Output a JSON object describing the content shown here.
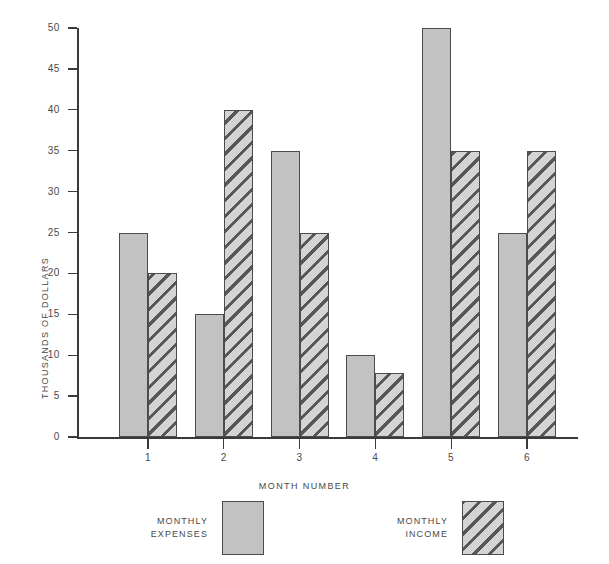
{
  "chart_data": {
    "type": "bar",
    "title": "",
    "xlabel": "MONTH NUMBER",
    "ylabel": "THOUSANDS OF DOLLARS",
    "categories": [
      "1",
      "2",
      "3",
      "4",
      "5",
      "6"
    ],
    "series": [
      {
        "name": "MONTHLY\nEXPENSES",
        "legend_label": "MONTHLY\nEXPENSES",
        "style": "solid-gray",
        "values": [
          25,
          15,
          35,
          10,
          50,
          25
        ]
      },
      {
        "name": "MONTHLY\nINCOME",
        "legend_label": "MONTHLY\nINCOME",
        "style": "diagonal-hatch",
        "values": [
          20,
          40,
          25,
          7.8,
          35,
          35
        ]
      }
    ],
    "ylim": [
      0,
      50
    ],
    "ytick_step": 5,
    "yticks": [
      "0",
      "5",
      "10",
      "15",
      "20",
      "25",
      "30",
      "35",
      "40",
      "45",
      "50"
    ],
    "grid": false,
    "legend_position": "below-plot",
    "colors": {
      "expenses_fill": "#c2c2c2",
      "income_fill": "#d4d4d4",
      "income_hatch": "#575757",
      "bar_border": "#4c4c4c",
      "axis": "#3a3a3a",
      "text": "#4a4a4a",
      "background": "#ffffff"
    }
  },
  "axes": {
    "x_title": "MONTH NUMBER",
    "y_title": "THOUSANDS OF DOLLARS"
  },
  "legend": {
    "items": [
      {
        "label": "MONTHLY\nEXPENSES",
        "swatch": "solid-gray-swatch"
      },
      {
        "label": "MONTHLY\nINCOME",
        "swatch": "hatched-swatch"
      }
    ]
  }
}
